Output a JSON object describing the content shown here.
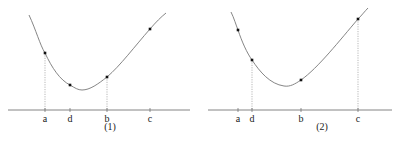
{
  "panels": [
    {
      "id": "panel-1",
      "caption": "(1)",
      "points": [
        {
          "label": "a",
          "x": 45,
          "y": 53,
          "dotted": true
        },
        {
          "label": "d",
          "x": 70,
          "y": 85,
          "dotted": false
        },
        {
          "label": "b",
          "x": 107,
          "y": 77,
          "dotted": true
        },
        {
          "label": "c",
          "x": 150,
          "y": 29,
          "dotted": false
        }
      ],
      "axis": {
        "x1": 8,
        "x2": 190,
        "y": 110
      },
      "curve": "M29,15 C36,30 40,45 45,53 C52,68 60,80 70,85 C75,88 78,90 82,90 C90,90 98,84 107,77 C120,66 135,46 150,29 C156,22 161,17 166,13",
      "caption_pos": {
        "x": 110,
        "y": 130
      }
    },
    {
      "id": "panel-2",
      "caption": "(2)",
      "points": [
        {
          "label": "a",
          "x": 238,
          "y": 30,
          "dotted": false
        },
        {
          "label": "d",
          "x": 252,
          "y": 60,
          "dotted": true
        },
        {
          "label": "b",
          "x": 301,
          "y": 80,
          "dotted": false
        },
        {
          "label": "c",
          "x": 358,
          "y": 19,
          "dotted": true
        }
      ],
      "axis": {
        "x1": 208,
        "x2": 392,
        "y": 110
      },
      "curve": "M231,12 C234,18 236,25 238,30 C242,42 247,53 252,60 C260,72 270,84 284,86 C290,87 295,84 301,80 C318,68 340,40 358,19 C362,15 365,11 368,8",
      "caption_pos": {
        "x": 322,
        "y": 130
      }
    }
  ],
  "colors": {
    "curve": "#777777",
    "axis": "#666666",
    "dot": "#111111",
    "dotted_line": "#999999",
    "text": "#222222"
  }
}
